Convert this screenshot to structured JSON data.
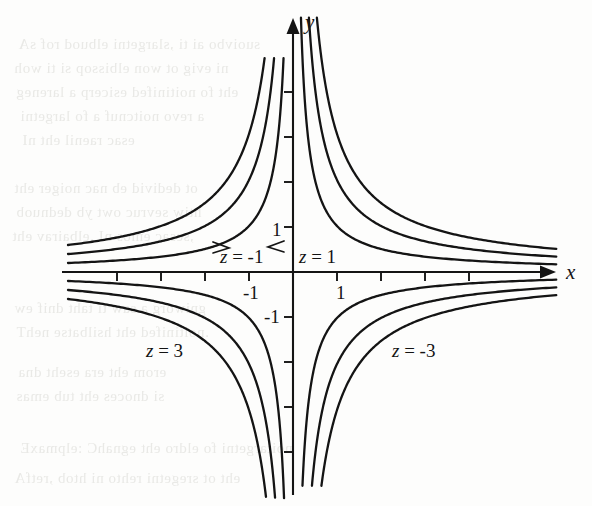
{
  "figure": {
    "width": 592,
    "height": 506,
    "background_color": "#fdfdfc",
    "ink_color": "#141414"
  },
  "axes": {
    "x_axis_label": "x",
    "y_axis_label": "y",
    "origin_px": {
      "x": 293,
      "y": 272
    },
    "unit_px": 45,
    "x_axis_y_px": 272,
    "y_axis_x_px": 293,
    "x_tick_positions_px": [
      117,
      161,
      205,
      249,
      293,
      337,
      381,
      425,
      469
    ],
    "y_tick_positions_px": [
      92,
      137,
      182,
      227,
      272,
      317,
      362,
      407,
      452
    ],
    "x_tick_labels": [
      {
        "text": "-1",
        "value": -1,
        "px_x": 243,
        "px_y": 282
      },
      {
        "text": "1",
        "value": 1,
        "px_x": 336,
        "px_y": 282
      }
    ],
    "y_tick_labels": [
      {
        "text": "1",
        "value": 1,
        "px_x": 272,
        "px_y": 219
      },
      {
        "text": "-1",
        "value": -1,
        "px_x": 264,
        "px_y": 306
      }
    ],
    "x_arrow_tip_px": {
      "x": 556,
      "y": 272
    },
    "y_arrow_tip_px": {
      "x": 293,
      "y": 18
    },
    "x_label_px": {
      "x": 566,
      "y": 260
    },
    "y_label_px": {
      "x": 305,
      "y": 10
    }
  },
  "curve_labels": [
    {
      "id": "z-neg-1",
      "text": "z = -1",
      "z": -1,
      "px_x": 220,
      "px_y": 246,
      "quadrant": "II"
    },
    {
      "id": "z-pos-1",
      "text": "z = 1",
      "z": 1,
      "px_x": 299,
      "px_y": 246,
      "quadrant": "I"
    },
    {
      "id": "z-pos-3",
      "text": "z = 3",
      "z": 3,
      "px_x": 146,
      "px_y": 340,
      "quadrant": "III"
    },
    {
      "id": "z-neg-3",
      "text": "z = -3",
      "z": -3,
      "px_x": 392,
      "px_y": 340,
      "quadrant": "IV"
    }
  ],
  "chart_data": {
    "type": "line",
    "title": "",
    "subtitle": "",
    "xlabel": "x",
    "ylabel": "y",
    "xlim": [
      -5.0,
      5.85
    ],
    "ylim": [
      -4.75,
      5.65
    ],
    "grid": false,
    "legend": "inline-curve-labels",
    "function_family": "y = z / x",
    "series": [
      {
        "name": "z = 1",
        "z": 1,
        "branches": [
          "Q1",
          "Q3"
        ],
        "label": "z = 1"
      },
      {
        "name": "z = 2",
        "z": 2,
        "branches": [
          "Q1",
          "Q3"
        ],
        "label": ""
      },
      {
        "name": "z = 3",
        "z": 3,
        "branches": [
          "Q1",
          "Q3"
        ],
        "label": "z = 3"
      },
      {
        "name": "z = -1",
        "z": -1,
        "branches": [
          "Q2",
          "Q4"
        ],
        "label": "z = -1"
      },
      {
        "name": "z = -2",
        "z": -2,
        "branches": [
          "Q2",
          "Q4"
        ],
        "label": ""
      },
      {
        "name": "z = -3",
        "z": -3,
        "branches": [
          "Q2",
          "Q4"
        ],
        "label": "z = -3"
      }
    ],
    "x_tick_values": [
      -4,
      -3,
      -2,
      -1,
      0,
      1,
      2,
      3,
      4
    ],
    "y_tick_values": [
      -4,
      -3,
      -2,
      -1,
      0,
      1,
      2,
      3,
      4
    ],
    "labeled_x_ticks": [
      -1,
      1
    ],
    "labeled_y_ticks": [
      -1,
      1
    ]
  },
  "background_bleed_lines": [
    {
      "text": "suoivbo  ai  ti  ,slargetni  elbuod  rof  sA",
      "px_x": 18,
      "px_y": 36
    },
    {
      "text": "ni  evig  ot  won  elbissop  si  ti  woh",
      "px_x": 14,
      "px_y": 60
    },
    {
      "text": "eht  fo  noitinifed  esicerp  a  lareneg",
      "px_x": 16,
      "px_y": 84
    },
    {
      "text": "a  revo  noitcnuf  a  fo  largetni",
      "px_x": 20,
      "px_y": 108
    },
    {
      "text": "esac  raenil  eht  nI",
      "px_x": 22,
      "px_y": 132
    },
    {
      "text": "ot  dedivid  eb  nac  noiger  eht",
      "px_x": 14,
      "px_y": 180
    },
    {
      "text": "htiw  sevruc  owt  yb  dednuob",
      "px_x": 16,
      "px_y": 204
    },
    {
      "text": ",sesac  emos  nI  .elbairav  eht",
      "px_x": 12,
      "px_y": 228
    },
    {
      "text": "gniworg  a  saw  ti  taht  dnif  ew",
      "px_x": 14,
      "px_y": 300
    },
    {
      "text": ".noitinifed  eht  hsilbatse  nehT",
      "px_x": 16,
      "px_y": 324
    },
    {
      "text": "erom  eht  era  eseht  dna",
      "px_x": 18,
      "px_y": 364
    },
    {
      "text": "si  dnoces  eht  tub  emas",
      "px_x": 16,
      "px_y": 388
    },
    {
      "text": "noitargetni  fo  eldro  eht  egnahC  :elpmaxE",
      "px_x": 20,
      "px_y": 440
    },
    {
      "text": "eht  ot  sregetni  rehto  ni  htob  ,retfA",
      "px_x": 14,
      "px_y": 470
    }
  ]
}
